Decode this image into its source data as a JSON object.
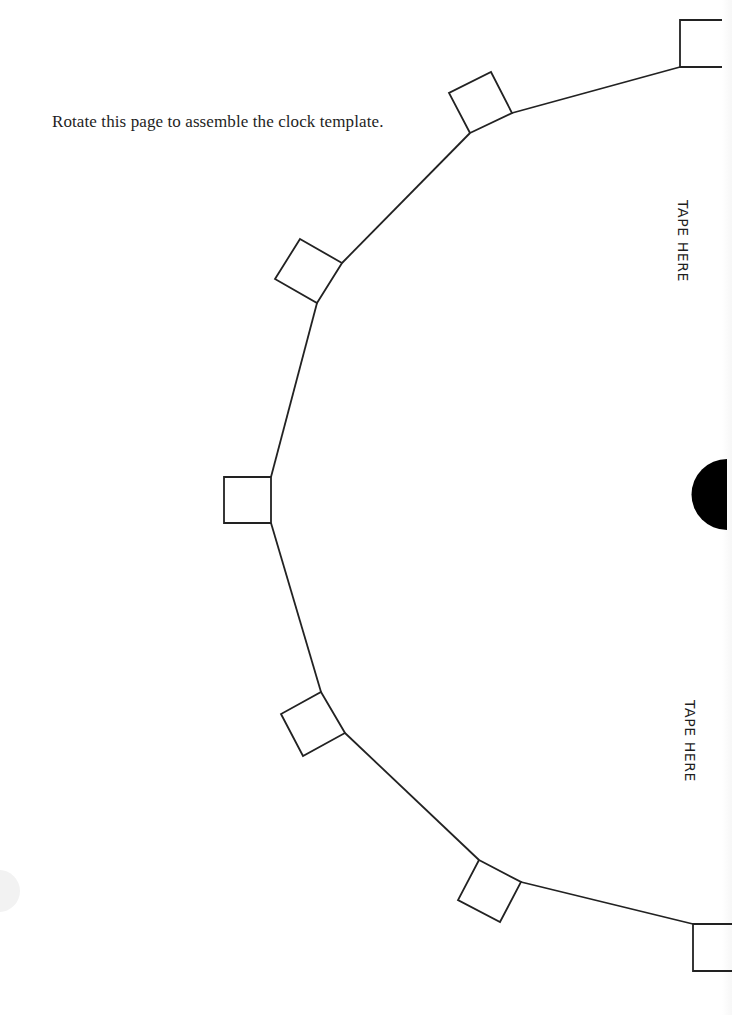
{
  "page": {
    "instruction": "Rotate this page to assemble the clock template.",
    "tape_labels": [
      "TAPE HERE",
      "TAPE HERE"
    ]
  },
  "template": {
    "stroke_color": "#222222",
    "fill_color": "#000000",
    "tab_count": 5,
    "edge_tabs": 2,
    "center_marker": "half-circle"
  }
}
